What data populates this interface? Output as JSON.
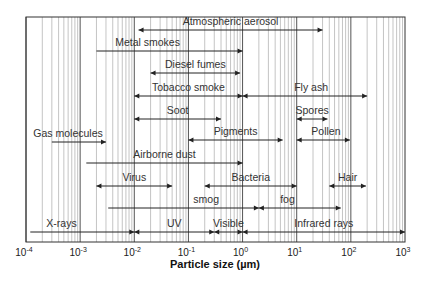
{
  "chart_data": {
    "type": "range-bar",
    "title": "",
    "xlabel": "Particle size (µm)",
    "ylabel": "",
    "xscale": "log",
    "xlim": [
      0.0001,
      1000
    ],
    "grid": true,
    "legend": null,
    "tick_labels": [
      {
        "base": "10",
        "exp": "-4",
        "value": 0.0001
      },
      {
        "base": "10",
        "exp": "-3",
        "value": 0.001
      },
      {
        "base": "10",
        "exp": "-2",
        "value": 0.01
      },
      {
        "base": "10",
        "exp": "-1",
        "value": 0.1
      },
      {
        "base": "10",
        "exp": "0",
        "value": 1
      },
      {
        "base": "10",
        "exp": "1",
        "value": 10
      },
      {
        "base": "10",
        "exp": "2",
        "value": 100
      },
      {
        "base": "10",
        "exp": "3",
        "value": 1000
      }
    ],
    "ranges": [
      {
        "label": "Atmospheric aerosol",
        "min": 0.012,
        "max": 30,
        "row": 0,
        "arrow_start": true,
        "arrow_end": true,
        "label_at": 0.5
      },
      {
        "label": "Metal smokes",
        "min": 0.002,
        "max": 1,
        "row": 1,
        "arrow_start": false,
        "arrow_end": true,
        "label_at": 0.35
      },
      {
        "label": "Diesel fumes",
        "min": 0.02,
        "max": 0.9,
        "row": 2,
        "arrow_start": true,
        "arrow_end": true,
        "label_at": 0.5
      },
      {
        "label": "Tobacco smoke",
        "min": 0.01,
        "max": 1,
        "row": 3,
        "arrow_start": true,
        "arrow_end": true,
        "label_at": 0.5
      },
      {
        "label": "Fly ash",
        "min": 1,
        "max": 200,
        "row": 3,
        "arrow_start": true,
        "arrow_end": true,
        "label_at": 0.55
      },
      {
        "label": "Soot",
        "min": 0.01,
        "max": 0.4,
        "row": 4,
        "arrow_start": true,
        "arrow_end": true,
        "label_at": 0.5
      },
      {
        "label": "Spores",
        "min": 10,
        "max": 37,
        "row": 4,
        "arrow_start": true,
        "arrow_end": true,
        "label_at": 0.5
      },
      {
        "label": "Pigments",
        "min": 0.1,
        "max": 5.5,
        "row": 5,
        "arrow_start": true,
        "arrow_end": true,
        "label_at": 0.5
      },
      {
        "label": "Pollen",
        "min": 10,
        "max": 96,
        "row": 5,
        "arrow_start": true,
        "arrow_end": true,
        "label_at": 0.55
      },
      {
        "label": "Gas molecules",
        "min": 0.0003,
        "max": 0.003,
        "row": 6,
        "arrow_start": false,
        "arrow_end": true,
        "label_at": 0.3
      },
      {
        "label": "Airborne dust",
        "min": 0.0013,
        "max": 1,
        "row": 7,
        "arrow_start": false,
        "arrow_end": true,
        "label_at": 0.5
      },
      {
        "label": "Virus",
        "min": 0.002,
        "max": 0.05,
        "row": 8,
        "arrow_start": true,
        "arrow_end": true,
        "label_at": 0.5
      },
      {
        "label": "Bacteria",
        "min": 0.2,
        "max": 10,
        "row": 8,
        "arrow_start": true,
        "arrow_end": true,
        "label_at": 0.5
      },
      {
        "label": "Hair",
        "min": 40,
        "max": 190,
        "row": 8,
        "arrow_start": true,
        "arrow_end": true,
        "label_at": 0.5
      },
      {
        "label": "smog",
        "min": 0.0033,
        "max": 2,
        "row": 9,
        "arrow_start": false,
        "arrow_end": true,
        "label_at": 0.65
      },
      {
        "label": "fog",
        "min": 2,
        "max": 65,
        "row": 9,
        "arrow_start": true,
        "arrow_end": true,
        "label_at": 0.35
      },
      {
        "label": "X-rays",
        "min": 0.00012,
        "max": 0.01,
        "row": 10,
        "arrow_start": false,
        "arrow_end": true,
        "label_at": 0.3
      },
      {
        "label": "UV",
        "min": 0.01,
        "max": 0.3,
        "row": 10,
        "arrow_start": true,
        "arrow_end": true,
        "label_at": 0.5
      },
      {
        "label": "Visible",
        "min": 0.3,
        "max": 1,
        "row": 10,
        "arrow_start": true,
        "arrow_end": true,
        "label_at": 0.5
      },
      {
        "label": "Infrared rays",
        "min": 1,
        "max": 1000,
        "row": 10,
        "arrow_start": true,
        "arrow_end": true,
        "label_at": 0.5
      }
    ]
  },
  "layout": {
    "plot_left": 26,
    "plot_right": 405,
    "plot_top": 17,
    "plot_bottom": 242,
    "row_y": [
      30,
      51,
      73,
      96,
      119,
      140,
      142,
      163,
      186,
      208,
      232
    ],
    "colors": {
      "major_grid": "#555555",
      "minor_grid": "#b5b5b5",
      "frame": "#333333",
      "arrow": "#222222",
      "text": "#333333"
    }
  }
}
